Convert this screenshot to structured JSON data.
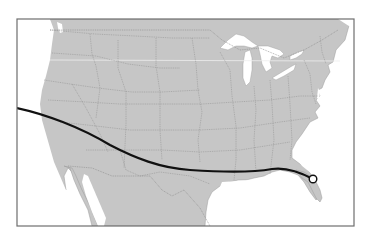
{
  "map": {
    "type": "route-map",
    "region": "North America (USA, southern Canada, northern Mexico)",
    "colors": {
      "background": "#ffffff",
      "land": "#c6c6c6",
      "water": "#ffffff",
      "borders": "#8a8a8a",
      "frame": "#6e6e6e",
      "route": "#111111",
      "marker_fill": "#ffffff",
      "marker_stroke": "#111111",
      "parallel_line": "#eeeeee"
    },
    "frame": {
      "x": 17,
      "y": 19,
      "width": 337,
      "height": 207
    },
    "route": {
      "description": "Curved trajectory entering from the Pacific west of California, crossing the southwestern US and Gulf coast, ending in central Florida",
      "points": [
        [
          17,
          108
        ],
        [
          45,
          115
        ],
        [
          80,
          128
        ],
        [
          110,
          145
        ],
        [
          150,
          158
        ],
        [
          180,
          167
        ],
        [
          210,
          172
        ],
        [
          250,
          172
        ],
        [
          275,
          168
        ],
        [
          295,
          173
        ],
        [
          313,
          179
        ]
      ]
    },
    "marker": {
      "shape": "circle",
      "x": 313,
      "y": 179,
      "r": 4,
      "location": "central Florida"
    }
  }
}
